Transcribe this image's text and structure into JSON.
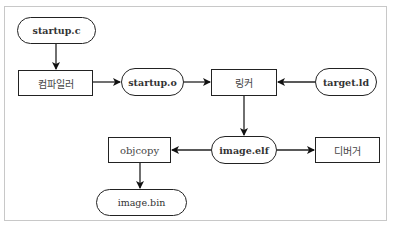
{
  "diagram": {
    "type": "flowchart",
    "nodes": {
      "startup_c": {
        "label": "startup.c",
        "shape": "terminal"
      },
      "compiler": {
        "label": "컴파일러",
        "shape": "process"
      },
      "startup_o": {
        "label": "startup.o",
        "shape": "terminal"
      },
      "linker": {
        "label": "링커",
        "shape": "process"
      },
      "target_ld": {
        "label": "target.ld",
        "shape": "terminal"
      },
      "image_elf": {
        "label": "image.elf",
        "shape": "terminal"
      },
      "objcopy": {
        "label": "objcopy",
        "shape": "process"
      },
      "debugger": {
        "label": "디버거",
        "shape": "process"
      },
      "image_bin": {
        "label": "image.bin",
        "shape": "terminal"
      }
    },
    "edges": [
      {
        "from": "startup.c",
        "to": "컴파일러"
      },
      {
        "from": "컴파일러",
        "to": "startup.o"
      },
      {
        "from": "startup.o",
        "to": "링커"
      },
      {
        "from": "target.ld",
        "to": "링커"
      },
      {
        "from": "링커",
        "to": "image.elf"
      },
      {
        "from": "image.elf",
        "to": "objcopy"
      },
      {
        "from": "image.elf",
        "to": "디버거"
      },
      {
        "from": "objcopy",
        "to": "image.bin"
      }
    ],
    "colors": {
      "stroke": "#222222",
      "frame": "#c8c8c8",
      "background": "#ffffff"
    }
  }
}
